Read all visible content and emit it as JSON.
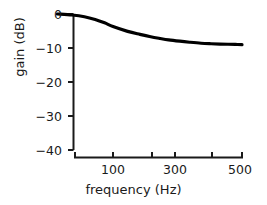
{
  "chart_data": {
    "type": "line",
    "title": "",
    "xlabel": "frequency (Hz)",
    "ylabel": "gain (dB)",
    "xscale": "log",
    "yscale": "linear",
    "xlim": [
      50,
      520
    ],
    "ylim": [
      -40,
      1
    ],
    "grid": false,
    "legend": null,
    "xticks_labeled": [
      100,
      300,
      500
    ],
    "xtick_labels": [
      "100",
      "300",
      "500"
    ],
    "xticks_minor": [
      200,
      400
    ],
    "yticks": [
      0,
      -10,
      -20,
      -30,
      -40
    ],
    "ytick_labels": [
      "0",
      "−10",
      "−20",
      "−30",
      "−40"
    ],
    "series": [
      {
        "name": "gain",
        "color": "#000000",
        "linewidth": 3.2,
        "x": [
          50,
          60,
          70,
          80,
          90,
          100,
          120,
          140,
          160,
          180,
          200,
          230,
          260,
          300,
          340,
          380,
          420,
          460,
          500
        ],
        "y": [
          0.0,
          -0.3,
          -0.8,
          -1.6,
          -2.6,
          -3.7,
          -5.1,
          -6.0,
          -6.7,
          -7.2,
          -7.6,
          -8.0,
          -8.3,
          -8.6,
          -8.75,
          -8.85,
          -8.9,
          -8.95,
          -9.0
        ]
      }
    ]
  },
  "axes": {
    "spine_color": "#1a1a1a",
    "tick_color": "#1a1a1a",
    "background": "#ffffff"
  }
}
